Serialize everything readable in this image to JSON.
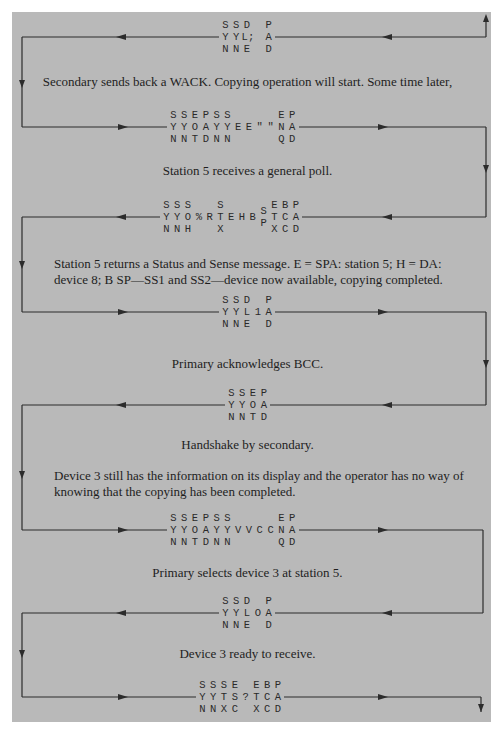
{
  "colors": {
    "panel": "#b9b9b9",
    "line": "#2c2c2c",
    "text": "#1e1e1e"
  },
  "frames": [
    {
      "id": "f1",
      "columns": [
        [
          "S",
          "Y",
          "N"
        ],
        [
          "S",
          "Y",
          "N"
        ],
        [
          "D",
          "L;",
          "E"
        ],
        [
          "",
          "",
          ""
        ],
        [
          "P",
          "A",
          "D"
        ]
      ],
      "direction": "left"
    },
    {
      "id": "f2",
      "columns": [
        [
          "S",
          "Y",
          "N"
        ],
        [
          "S",
          "Y",
          "N"
        ],
        [
          "E",
          "O",
          "T"
        ],
        [
          "P",
          "A",
          "D"
        ],
        [
          "S",
          "Y",
          "N"
        ],
        [
          "S",
          "Y",
          "N"
        ],
        [
          "",
          "E",
          ""
        ],
        [
          "",
          "E",
          ""
        ],
        [
          "",
          "\"",
          ""
        ],
        [
          "",
          "\"",
          ""
        ],
        [
          "E",
          "N",
          "Q"
        ],
        [
          "P",
          "A",
          "D"
        ]
      ],
      "direction": "right"
    },
    {
      "id": "f3",
      "columns": [
        [
          "S",
          "Y",
          "N"
        ],
        [
          "S",
          "Y",
          "N"
        ],
        [
          "S",
          "O",
          "H"
        ],
        [
          "",
          "%",
          ""
        ],
        [
          "",
          "R",
          ""
        ],
        [
          "S",
          "T",
          "X"
        ],
        [
          "",
          "E",
          ""
        ],
        [
          "",
          "H",
          ""
        ],
        [
          "",
          "B",
          ""
        ],
        [
          "S",
          "",
          "P"
        ],
        [
          "E",
          "T",
          "X"
        ],
        [
          "B",
          "C",
          "C"
        ],
        [
          "P",
          "A",
          "D"
        ]
      ],
      "direction": "left"
    },
    {
      "id": "f4",
      "columns": [
        [
          "S",
          "Y",
          "N"
        ],
        [
          "S",
          "Y",
          "N"
        ],
        [
          "D",
          "L",
          "E"
        ],
        [
          "",
          "1",
          ""
        ],
        [
          "P",
          "A",
          "D"
        ]
      ],
      "direction": "right"
    },
    {
      "id": "f5",
      "columns": [
        [
          "S",
          "Y",
          "N"
        ],
        [
          "S",
          "Y",
          "N"
        ],
        [
          "E",
          "O",
          "T"
        ],
        [
          "P",
          "A",
          "D"
        ]
      ],
      "direction": "left"
    },
    {
      "id": "f6",
      "columns": [
        [
          "S",
          "Y",
          "N"
        ],
        [
          "S",
          "Y",
          "N"
        ],
        [
          "E",
          "O",
          "T"
        ],
        [
          "P",
          "A",
          "D"
        ],
        [
          "S",
          "Y",
          "N"
        ],
        [
          "S",
          "Y",
          "N"
        ],
        [
          "",
          "V",
          ""
        ],
        [
          "",
          "V",
          ""
        ],
        [
          "",
          "C",
          ""
        ],
        [
          "",
          "C",
          ""
        ],
        [
          "E",
          "N",
          "Q"
        ],
        [
          "P",
          "A",
          "D"
        ]
      ],
      "direction": "right"
    },
    {
      "id": "f7",
      "columns": [
        [
          "S",
          "Y",
          "N"
        ],
        [
          "S",
          "Y",
          "N"
        ],
        [
          "D",
          "L",
          "E"
        ],
        [
          "",
          "O",
          ""
        ],
        [
          "P",
          "A",
          "D"
        ]
      ],
      "direction": "left"
    },
    {
      "id": "f8",
      "columns": [
        [
          "S",
          "Y",
          "N"
        ],
        [
          "S",
          "Y",
          "N"
        ],
        [
          "S",
          "T",
          "X"
        ],
        [
          "E",
          "S",
          "C"
        ],
        [
          "",
          "?",
          ""
        ],
        [
          "E",
          "T",
          "X"
        ],
        [
          "B",
          "C",
          "C"
        ],
        [
          "P",
          "A",
          "D"
        ]
      ],
      "direction": "right"
    }
  ],
  "captions": {
    "c1": "Secondary sends back a WACK. Copying operation will start. Some time later,",
    "c2": "Station 5 receives a general poll.",
    "c3": "Station 5 returns a Status and Sense message. E = SPA: station 5; H = DA: device 8; B SP—SS1 and SS2—device now available, copying completed.",
    "c4": "Primary acknowledges BCC.",
    "c5": "Handshake by secondary.",
    "c6": "Device 3 still has the information on its display and the operator has no way of knowing that the copying has been completed.",
    "c7": "Primary selects device 3 at station 5.",
    "c8": "Device 3 ready to receive."
  }
}
